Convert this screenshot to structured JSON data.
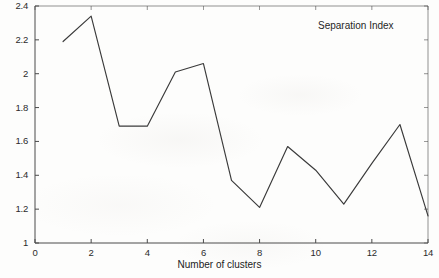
{
  "chart_data": {
    "type": "line",
    "title": "",
    "annotation": "Separation Index",
    "xlabel": "Number of clusters",
    "ylabel": "",
    "grid": false,
    "legend_position": "top-right-annotation",
    "xlim": [
      0,
      14
    ],
    "ylim": [
      1,
      2.4
    ],
    "xticks": [
      0,
      2,
      4,
      6,
      8,
      10,
      12,
      14
    ],
    "xtick_labels": [
      "0",
      "2",
      "4",
      "6",
      "8",
      "10",
      "12",
      "14"
    ],
    "yticks": [
      1,
      1.2,
      1.4,
      1.6,
      1.8,
      2,
      2.2,
      2.4
    ],
    "ytick_labels": [
      "1",
      "1.2",
      "1.4",
      "1.6",
      "1.8",
      "2",
      "2.2",
      "2.4"
    ],
    "series": [
      {
        "name": "Separation Index",
        "color": "#3a3a3a",
        "x": [
          1,
          2,
          3,
          4,
          5,
          6,
          7,
          8,
          9,
          10,
          11,
          12,
          13,
          14
        ],
        "values": [
          2.19,
          2.34,
          1.69,
          1.69,
          2.01,
          2.06,
          1.37,
          1.21,
          1.57,
          1.43,
          1.23,
          1.47,
          1.7,
          1.16
        ]
      }
    ]
  },
  "colors": {
    "axis": "#4a4a4a",
    "line": "#3a3a3a",
    "text": "#262626",
    "background": "#fdfdfc"
  }
}
